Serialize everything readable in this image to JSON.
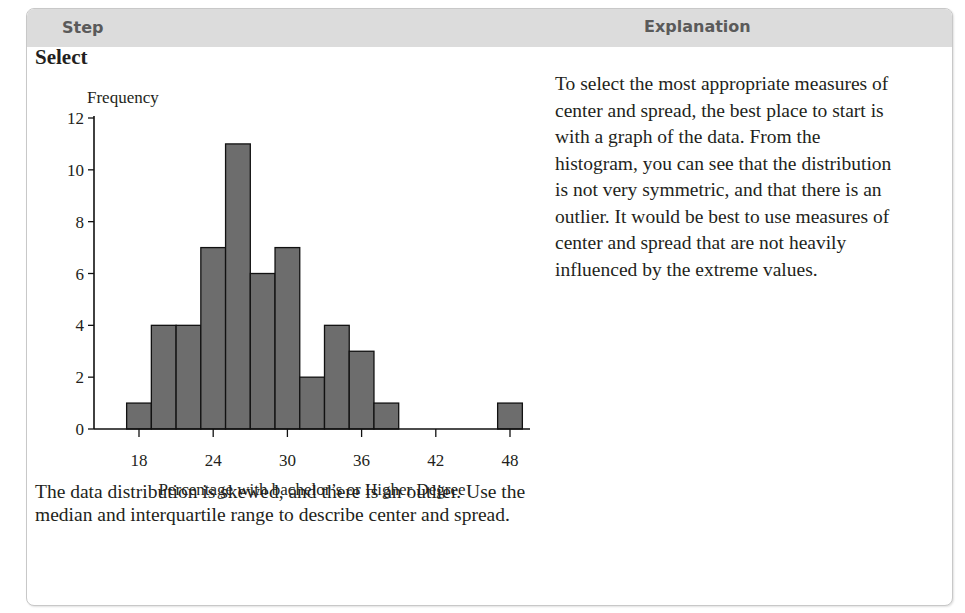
{
  "header": {
    "step_label": "Step",
    "explanation_label": "Explanation"
  },
  "step": {
    "title": "Select",
    "summary": "The data distribution is skewed, and there is an outlier. Use the median and interquartile range to describe center and spread."
  },
  "explanation": {
    "text": "To select the most appropriate measures of center and spread, the best place to start is with a graph of the data. From the histogram, you can see that the distribution is not very symmetric, and that there is an outlier. It would be best to use measures of center and spread that are not heavily influenced by the extreme values."
  },
  "colors": {
    "header_bg": "#dcdcdc",
    "header_text": "#5a5a5a",
    "bar_fill": "#6d6d6d",
    "bar_stroke": "#111111"
  },
  "chart_data": {
    "type": "bar",
    "subtype": "histogram",
    "title": "",
    "xlabel": "Percentage with bachelor’s or Higher Degree",
    "ylabel": "Frequency",
    "bin_width": 2,
    "bins": [
      {
        "start": 17,
        "end": 19,
        "count": 1
      },
      {
        "start": 19,
        "end": 21,
        "count": 4
      },
      {
        "start": 21,
        "end": 23,
        "count": 4
      },
      {
        "start": 23,
        "end": 25,
        "count": 7
      },
      {
        "start": 25,
        "end": 27,
        "count": 11
      },
      {
        "start": 27,
        "end": 29,
        "count": 6
      },
      {
        "start": 29,
        "end": 31,
        "count": 7
      },
      {
        "start": 31,
        "end": 33,
        "count": 2
      },
      {
        "start": 33,
        "end": 35,
        "count": 4
      },
      {
        "start": 35,
        "end": 37,
        "count": 3
      },
      {
        "start": 37,
        "end": 39,
        "count": 1
      },
      {
        "start": 39,
        "end": 41,
        "count": 0
      },
      {
        "start": 41,
        "end": 43,
        "count": 0
      },
      {
        "start": 43,
        "end": 45,
        "count": 0
      },
      {
        "start": 45,
        "end": 47,
        "count": 0
      },
      {
        "start": 47,
        "end": 49,
        "count": 1
      }
    ],
    "categories": [
      "18",
      "20",
      "22",
      "24",
      "26",
      "28",
      "30",
      "32",
      "34",
      "36",
      "38",
      "40",
      "42",
      "44",
      "46",
      "48"
    ],
    "values": [
      1,
      4,
      4,
      7,
      11,
      6,
      7,
      2,
      4,
      3,
      1,
      0,
      0,
      0,
      0,
      1
    ],
    "x_ticks": [
      18,
      24,
      30,
      36,
      42,
      48
    ],
    "y_ticks": [
      0,
      2,
      4,
      6,
      8,
      10,
      12
    ],
    "xlim": [
      15.4,
      49.6
    ],
    "ylim": [
      0,
      12
    ],
    "grid": false,
    "legend": null
  }
}
